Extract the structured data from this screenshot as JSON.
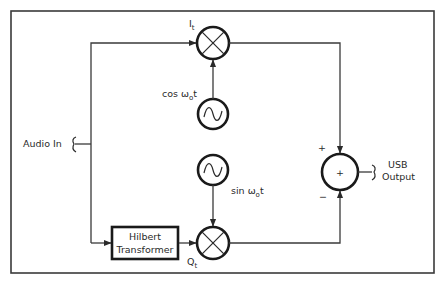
{
  "diagram": {
    "input_label": "Audio In",
    "output_label_line1": "USB",
    "output_label_line2": "Output",
    "hilbert_line1": "Hilbert",
    "hilbert_line2": "Transformer",
    "i_label": "I",
    "i_sub": "t",
    "q_label": "Q",
    "q_sub": "t",
    "cos_label": "cos ω",
    "cos_sub": "o",
    "cos_t": "t",
    "sin_label": "sin ω",
    "sin_sub": "o",
    "sin_t": "t",
    "summer_symbol": "+",
    "summer_plus": "+",
    "summer_minus": "−",
    "line_color": "#3a3a3a"
  }
}
